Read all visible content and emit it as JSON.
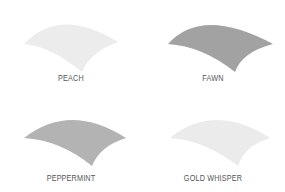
{
  "swatches": [
    {
      "name": "PEACH",
      "fill": "#ececec",
      "stripe": "#f7f7f7"
    },
    {
      "name": "FAWN",
      "fill": "#a2a2a2",
      "stripe": "#ababab"
    },
    {
      "name": "PEPPERMINT",
      "fill": "#b3b3b3",
      "stripe": "#bcbcbc"
    },
    {
      "name": "GOLD WHISPER",
      "fill": "#ebebeb",
      "stripe": "#f6f6f6"
    }
  ]
}
